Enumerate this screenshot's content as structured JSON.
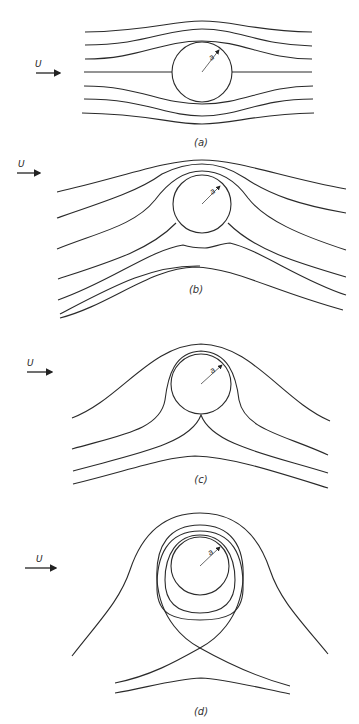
{
  "figure": {
    "panels": [
      {
        "id": "a",
        "caption": "(a)",
        "flow_label": "U",
        "radius_label": "a",
        "description": "Uniform flow past a circular cylinder, no circulation"
      },
      {
        "id": "b",
        "caption": "(b)",
        "flow_label": "U",
        "radius_label": "a",
        "description": "Flow past cylinder with small circulation"
      },
      {
        "id": "c",
        "caption": "(c)",
        "flow_label": "U",
        "radius_label": "a",
        "description": "Critical circulation, stagnation point at bottom of cylinder"
      },
      {
        "id": "d",
        "caption": "(d)",
        "flow_label": "U",
        "radius_label": "a",
        "description": "Large circulation, stagnation point detached below cylinder"
      }
    ],
    "colors": {
      "line": "#2a2a2a",
      "background": "#ffffff"
    }
  }
}
